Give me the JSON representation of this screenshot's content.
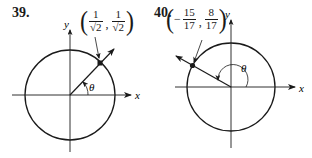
{
  "figures": [
    {
      "number": "39.",
      "point_label": {
        "open": "(",
        "x_sign": "",
        "x_num": "1",
        "x_den": "√2",
        "separator": ",",
        "y_num": "1",
        "y_den": "√2",
        "close": ")"
      },
      "x_axis_label": "x",
      "y_axis_label": "y",
      "angle_label": "θ",
      "quadrant": "I"
    },
    {
      "number": "40.",
      "point_label": {
        "open": "(",
        "x_sign": "−",
        "x_num": "15",
        "x_den": "17",
        "separator": ",",
        "y_num": "8",
        "y_den": "17",
        "close": ")"
      },
      "x_axis_label": "x",
      "y_axis_label": "y",
      "angle_label": "θ",
      "quadrant": "II"
    }
  ],
  "colors": {
    "ink": "#1a1a1a",
    "background": "#ffffff"
  }
}
